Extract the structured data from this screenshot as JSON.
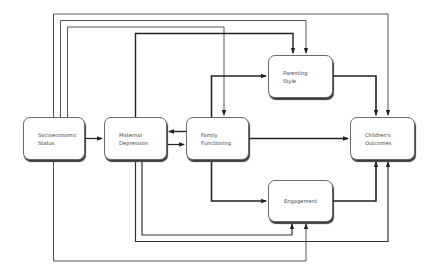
{
  "diagram": {
    "type": "path-model",
    "nodes": [
      {
        "id": "ses",
        "lines": [
          "Socioeconomic",
          "Status"
        ]
      },
      {
        "id": "md",
        "lines": [
          "Maternal",
          "Depression"
        ]
      },
      {
        "id": "ff",
        "lines": [
          "Family",
          "Functioning"
        ]
      },
      {
        "id": "ps",
        "lines": [
          "Parenting",
          "Style"
        ]
      },
      {
        "id": "co",
        "lines": [
          "Children's",
          "Outcomes"
        ]
      },
      {
        "id": "eng",
        "lines": [
          "Engagement"
        ]
      }
    ],
    "edges": [
      {
        "from": "ses",
        "to": "md"
      },
      {
        "from": "md",
        "to": "ff"
      },
      {
        "from": "ff",
        "to": "md"
      },
      {
        "from": "ff",
        "to": "ps"
      },
      {
        "from": "ff",
        "to": "co"
      },
      {
        "from": "ff",
        "to": "eng"
      },
      {
        "from": "ps",
        "to": "co"
      },
      {
        "from": "eng",
        "to": "co"
      },
      {
        "from": "ses",
        "to": "co"
      },
      {
        "from": "ses",
        "to": "ps"
      },
      {
        "from": "ses",
        "to": "ff"
      },
      {
        "from": "ses",
        "to": "eng"
      },
      {
        "from": "md",
        "to": "ps"
      },
      {
        "from": "md",
        "to": "eng"
      },
      {
        "from": "md",
        "to": "co"
      }
    ]
  }
}
